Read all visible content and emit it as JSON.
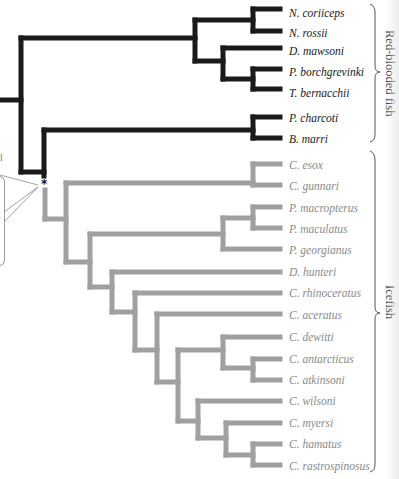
{
  "figure": {
    "type": "phylogenetic-tree",
    "colors": {
      "red_blooded_branch": "#1a1a1a",
      "icefish_branch": "#a0a0a0",
      "red_blooded_label": "#1a1a1a",
      "icefish_label": "#8a8a8a",
      "bracket": "#555555"
    },
    "node_marker": "*",
    "partial_left_text": "l",
    "clades": [
      {
        "name": "Red-blooded fish",
        "taxa_range": [
          0,
          6
        ]
      },
      {
        "name": "Icefish",
        "taxa_range": [
          7,
          21
        ]
      }
    ],
    "taxa": [
      {
        "name": "N. coriiceps",
        "group": "red"
      },
      {
        "name": "N. rossii",
        "group": "red"
      },
      {
        "name": "D. mawsoni",
        "group": "red"
      },
      {
        "name": "P. borchgrevinki",
        "group": "red"
      },
      {
        "name": "T. bernacchii",
        "group": "red"
      },
      {
        "name": "P. charcoti",
        "group": "red"
      },
      {
        "name": "B. marri",
        "group": "red"
      },
      {
        "name": "C. esox",
        "group": "ice"
      },
      {
        "name": "C. gunnari",
        "group": "ice"
      },
      {
        "name": "P. macropterus",
        "group": "ice"
      },
      {
        "name": "P. maculatus",
        "group": "ice"
      },
      {
        "name": "P. georgianus",
        "group": "ice"
      },
      {
        "name": "D. hunteri",
        "group": "ice"
      },
      {
        "name": "C. rhinoceratus",
        "group": "ice"
      },
      {
        "name": "C. aceratus",
        "group": "ice"
      },
      {
        "name": "C. dewitti",
        "group": "ice"
      },
      {
        "name": "C. antarcticus",
        "group": "ice"
      },
      {
        "name": "C. atkinsoni",
        "group": "ice"
      },
      {
        "name": "C. wilsoni",
        "group": "ice"
      },
      {
        "name": "C. myersi",
        "group": "ice"
      },
      {
        "name": "C. hamatus",
        "group": "ice"
      },
      {
        "name": "C. rastrospinosus",
        "group": "ice"
      }
    ]
  }
}
